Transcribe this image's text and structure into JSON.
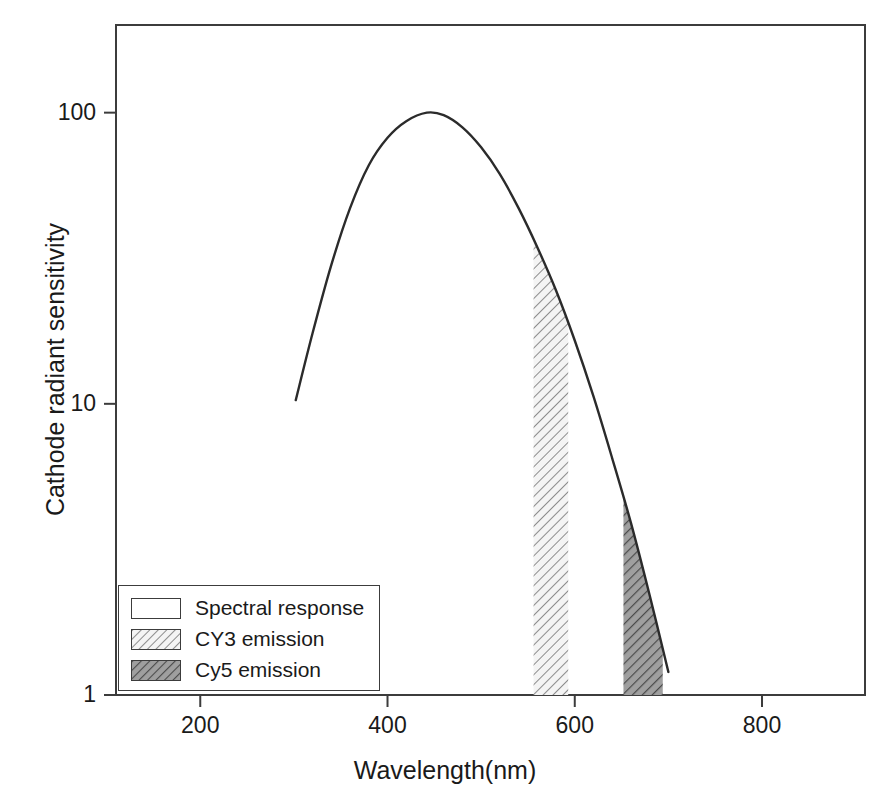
{
  "chart_data": {
    "type": "line",
    "title": "",
    "xlabel": "Wavelength(nm)",
    "ylabel": "Cathode radiant sensitivity",
    "xlim": [
      110,
      910
    ],
    "ylim": [
      1,
      200
    ],
    "yscale": "log",
    "xscale": "linear",
    "grid": false,
    "legend_position": "lower-left",
    "xticks": [
      "200",
      "400",
      "600",
      "800"
    ],
    "xtick_values": [
      200,
      400,
      600,
      800
    ],
    "yticks": [
      "100",
      "10",
      "1"
    ],
    "ytick_values": [
      100,
      10,
      1
    ],
    "series": [
      {
        "name": "Spectral response",
        "type": "line",
        "style": "solid-black-curve",
        "x": [
          302,
          320,
          340,
          360,
          380,
          400,
          420,
          442,
          460,
          480,
          500,
          520,
          540,
          560,
          580,
          600,
          620,
          640,
          660,
          680,
          700
        ],
        "y": [
          10.3,
          17.5,
          30.0,
          47.0,
          66.0,
          82.0,
          93.5,
          100.0,
          98.0,
          89.0,
          76.0,
          61.5,
          47.0,
          34.5,
          24.5,
          16.5,
          10.6,
          6.5,
          3.9,
          2.2,
          1.2
        ]
      },
      {
        "name": "CY3 emission",
        "type": "filled-band",
        "style": "light-hatch",
        "x_start": 556,
        "x_end": 593,
        "y_top_at_start": 36.0,
        "y_top_at_end": 21.5,
        "y_bottom": 1
      },
      {
        "name": "Cy5 emission",
        "type": "filled-band",
        "style": "dark-hatch",
        "x_start": 652,
        "x_end": 694,
        "y_top_at_start": 5.0,
        "y_top_at_end": 1.4,
        "y_bottom": 1
      }
    ],
    "legend_entries": [
      {
        "label": "Spectral response",
        "swatch": "empty"
      },
      {
        "label": "CY3 emission",
        "swatch": "light-hatch"
      },
      {
        "label": "Cy5 emission",
        "swatch": "dark-hatch"
      }
    ],
    "colors": {
      "curve": "#2b2b2b",
      "frame": "#3c3c3c",
      "text": "#1a1a1a",
      "cy3_hatch": "#8c8c8c",
      "cy3_fill": "#f2f2f2",
      "cy5_hatch": "#4a4a4a",
      "cy5_fill": "#a8a8a8",
      "background": "#ffffff"
    }
  },
  "axis": {
    "x_title": "Wavelength(nm)",
    "y_title": "Cathode radiant sensitivity",
    "x_tick_200": "200",
    "x_tick_400": "400",
    "x_tick_600": "600",
    "x_tick_800": "800",
    "y_tick_100": "100",
    "y_tick_10": "10",
    "y_tick_1": "1"
  },
  "legend": {
    "item_spectral": "Spectral response",
    "item_cy3": "CY3 emission",
    "item_cy5": "Cy5 emission"
  }
}
